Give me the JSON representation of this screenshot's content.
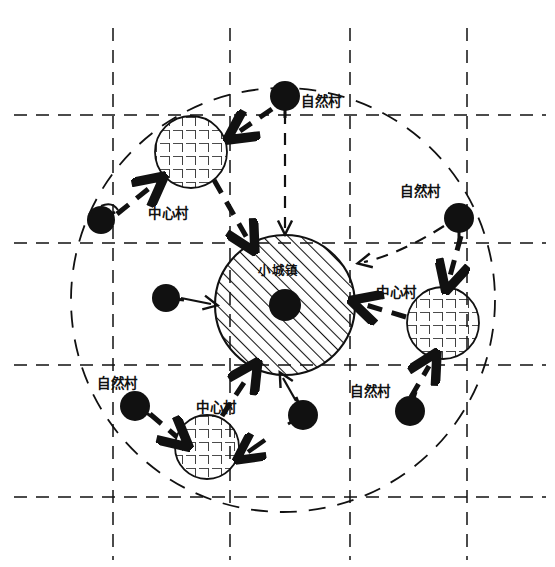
{
  "diagram": {
    "title": "",
    "colors": {
      "ink": "#111111",
      "background": "#ffffff",
      "hatch": "#111111",
      "grid": "#111111"
    },
    "center": {
      "label": "小城镇",
      "kind": "hatched-circle",
      "cx": 285,
      "cy": 305,
      "r": 70,
      "dot_r": 16
    },
    "boundary": {
      "kind": "dashed-circle",
      "cx": 283,
      "cy": 300,
      "r": 212
    },
    "grid": {
      "vertical_x": [
        113,
        230,
        350,
        467
      ],
      "horizontal_y": [
        115,
        243,
        365,
        497
      ]
    },
    "central_villages": [
      {
        "label": "中心村",
        "cx": 191,
        "cy": 152,
        "r": 36,
        "label_x": 175,
        "label_y": 214
      },
      {
        "label": "中心村",
        "cx": 443,
        "cy": 323,
        "r": 36,
        "label_x": 400,
        "label_y": 293
      },
      {
        "label": "中心村",
        "cx": 207,
        "cy": 447,
        "r": 32,
        "label_x": 222,
        "label_y": 409
      }
    ],
    "natural_villages": [
      {
        "label": "自然村",
        "cx": 285,
        "cy": 96,
        "r": 15,
        "label_x": 300,
        "label_y": 106
      },
      {
        "label": "自然村",
        "cx": 459,
        "cy": 218,
        "r": 15,
        "label_x": 403,
        "label_y": 194
      },
      {
        "label": "自然村",
        "cx": 101,
        "cy": 220,
        "r": 14,
        "label_x": null,
        "label_y": null
      },
      {
        "label": "自然村",
        "cx": 166,
        "cy": 298,
        "r": 14,
        "label_x": null,
        "label_y": null
      },
      {
        "label": "自然村",
        "cx": 135,
        "cy": 406,
        "r": 15,
        "label_x": 120,
        "label_y": 386
      },
      {
        "label": "自然村",
        "cx": 303,
        "cy": 415,
        "r": 15,
        "label_x": null,
        "label_y": null
      },
      {
        "label": "自然村",
        "cx": 410,
        "cy": 411,
        "r": 15,
        "label_x": 375,
        "label_y": 394
      }
    ],
    "flows": {
      "thick_dashed": "natural village to central village, central village to small town",
      "thin_solid": "natural village direct to small town"
    },
    "legend_terms": {
      "small_town": "小城镇",
      "central_village": "中心村",
      "natural_village": "自然村"
    }
  }
}
